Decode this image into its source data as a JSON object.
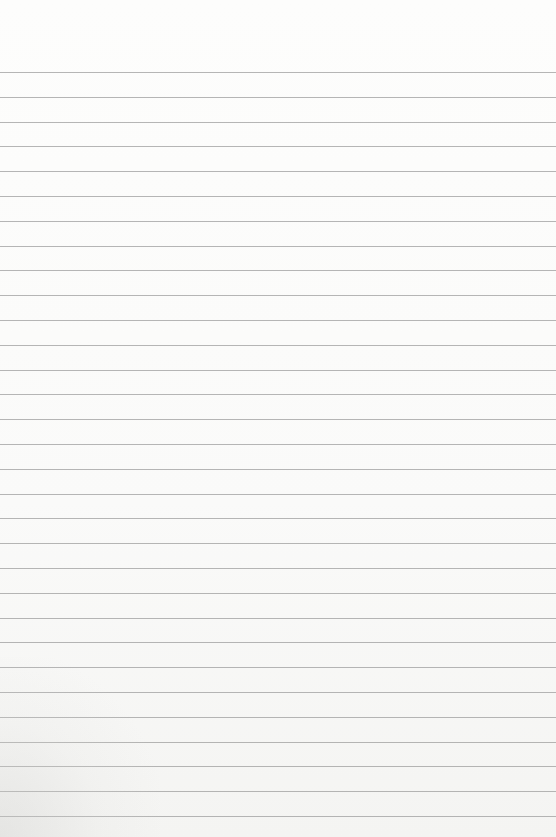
{
  "paper": {
    "type": "lined-sheet",
    "background_color": "#fbfbfa",
    "rule_color": "#9d9d9d",
    "rule_count": 31,
    "first_rule_y": 72,
    "rule_spacing": 24.8
  }
}
